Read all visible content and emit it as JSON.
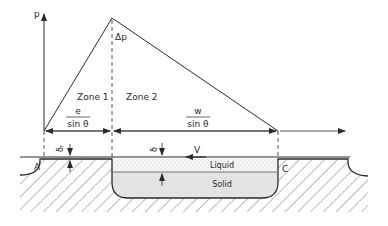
{
  "diagram": {
    "axis_label": "p",
    "peak_label": "Δp",
    "zone1_label": "Zone 1",
    "zone2_label": "Zone 2",
    "dim1": {
      "numerator": "e",
      "denominator": "sin θ"
    },
    "dim2": {
      "numerator": "w",
      "denominator": "sin θ"
    },
    "delta_r_label": "δᵣ",
    "delta_label": "δ",
    "velocity_label": "V",
    "liquid_label": "Liquid",
    "solid_label": "Solid",
    "point_a_label": "A",
    "point_c_label": "C",
    "colors": {
      "line": "#2a2a2a",
      "solid_fill": "#e3e3e3",
      "liquid_fill": "#f4f4f4"
    }
  }
}
